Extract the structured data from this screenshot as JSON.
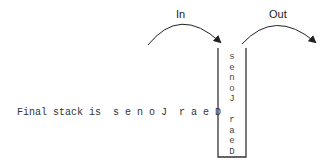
{
  "diagram": {
    "in_label": "In",
    "out_label": "Out",
    "final_text": "Final stack is  s e n o J  r a e D",
    "stack_items": [
      "s",
      "e",
      "n",
      "o",
      "J",
      "",
      "r",
      "a",
      "e",
      "D"
    ]
  }
}
